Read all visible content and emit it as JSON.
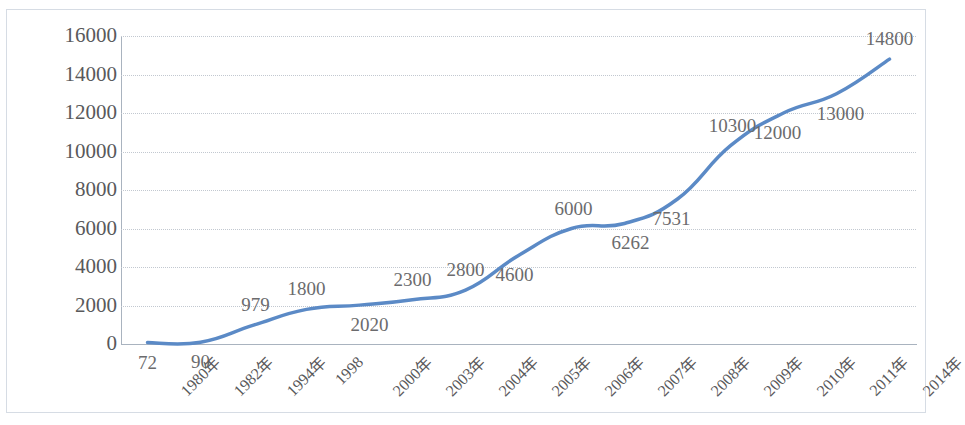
{
  "chart_data": {
    "type": "line",
    "title": "",
    "subtitle": "",
    "xlabel": "",
    "ylabel": "",
    "categories": [
      "1980年",
      "1982年",
      "1994年",
      "1998",
      "2000年",
      "2003年",
      "2004年",
      "2005年",
      "2006年",
      "2007年",
      "2008年",
      "2009年",
      "2010年",
      "2011年",
      "2014年"
    ],
    "values": [
      72,
      90,
      979,
      1800,
      2020,
      2300,
      2800,
      4600,
      6000,
      6262,
      7531,
      10300,
      12000,
      13000,
      14800
    ],
    "data_labels": [
      "72",
      "90",
      "979",
      "1800",
      "2020",
      "2300",
      "2800",
      "4600",
      "6000",
      "6262",
      "7531",
      "10300",
      "12000",
      "13000",
      "14800"
    ],
    "label_positions": [
      "below",
      "below",
      "above",
      "above",
      "below",
      "above",
      "above",
      "below",
      "above",
      "below",
      "below",
      "above",
      "below",
      "below",
      "above"
    ],
    "ylim": [
      0,
      16000
    ],
    "ytick_values": [
      0,
      2000,
      4000,
      6000,
      8000,
      10000,
      12000,
      14000,
      16000
    ],
    "ytick_labels": [
      "0",
      "2000",
      "4000",
      "6000",
      "8000",
      "10000",
      "12000",
      "14000",
      "16000"
    ],
    "grid": true,
    "grid_axis": "y",
    "grid_style": "dotted",
    "legend": false,
    "legend_position": "none",
    "smooth": true,
    "markers": false,
    "series": [
      {
        "name": "",
        "color": "#5b8ac6",
        "line_width": 3.5,
        "values": [
          72,
          90,
          979,
          1800,
          2020,
          2300,
          2800,
          4600,
          6000,
          6262,
          7531,
          10300,
          12000,
          13000,
          14800
        ]
      }
    ],
    "colors": {
      "line": "#5b8ac6",
      "gridline": "#c2c8d0",
      "axis": "#a9b3bf",
      "tick_text": "#59595b",
      "data_label_text": "#6b6b6d",
      "frame_border": "#d6dce4",
      "plot_background": "#ffffff"
    }
  }
}
